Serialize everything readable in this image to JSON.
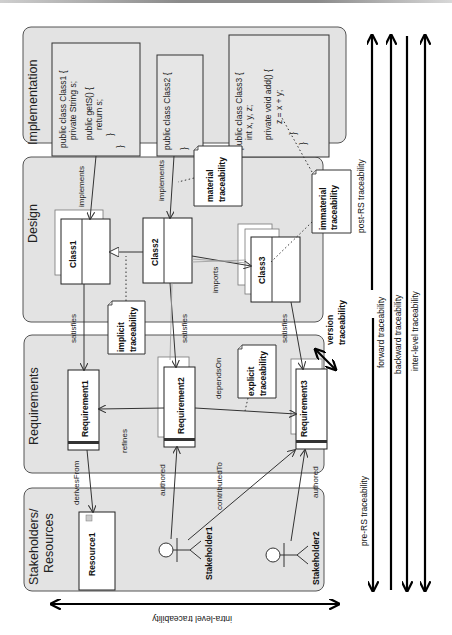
{
  "figure": {
    "orientation": "rotated-90-ccw",
    "panels": [
      {
        "id": "implementation",
        "title": "Implementation"
      },
      {
        "id": "design",
        "title": "Design"
      },
      {
        "id": "requirements",
        "title": "Requirements"
      },
      {
        "id": "stakeholders",
        "title_line1": "Stakeholders/",
        "title_line2": "Resources"
      }
    ],
    "code": {
      "class1": [
        "public class Class1 {",
        "private String s;",
        "public getS() {",
        "return s;",
        "}",
        "}"
      ],
      "class2": [
        "public class Class2 {",
        "}"
      ],
      "class3": [
        "public class Class3 {",
        "int x, y, z;",
        "private void add() {",
        "z = x + y;",
        "}",
        "}"
      ]
    },
    "design_classes": [
      "Class1",
      "Class2",
      "Class3"
    ],
    "requirements": [
      "Requirement1",
      "Requirement2",
      "Requirement3"
    ],
    "resources": [
      "Resource1"
    ],
    "stakeholders": [
      "Stakeholder1",
      "Stakeholder2"
    ],
    "relations": {
      "implements1": "implements",
      "implements2": "implements",
      "satisfies1": "satisfies",
      "satisfies2": "satisfies",
      "satisfies3": "satisfies",
      "imports": "imports",
      "refines": "refines",
      "dependsOn": "dependsOn",
      "derivesFrom": "derivesFrom",
      "authored1": "authored",
      "contributedTo": "contributedTo",
      "authored2": "authored"
    },
    "notes": {
      "material": [
        "material",
        "traceability"
      ],
      "immaterial": [
        "immaterial",
        "traceability"
      ],
      "implicit": [
        "implicit",
        "traceability"
      ],
      "explicit": [
        "explicit",
        "traceability"
      ],
      "version": [
        "version",
        "traceability"
      ]
    },
    "traceability_axes": {
      "post_rs": "post-RS traceability",
      "pre_rs": "pre-RS traceability",
      "forward": "forward traceability",
      "backward": "backward traceability",
      "inter_level": "inter-level traceability",
      "intra_level": "intra-level traceability"
    }
  }
}
